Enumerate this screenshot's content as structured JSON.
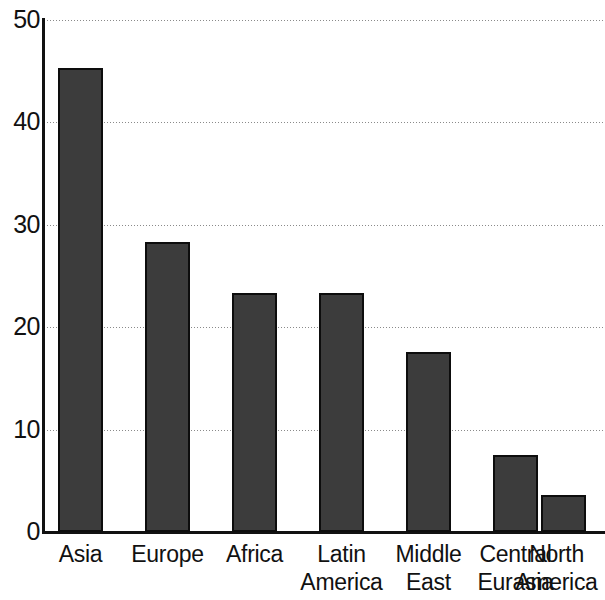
{
  "chart_data": {
    "type": "bar",
    "title": "",
    "subtitle": "",
    "xlabel": "",
    "ylabel": "",
    "ylim": [
      0,
      50
    ],
    "yticks": [
      0,
      10,
      20,
      30,
      40,
      50
    ],
    "ytick_labels": [
      "0",
      "10",
      "20",
      "30",
      "40",
      "50"
    ],
    "grid": true,
    "grid_axis": "y",
    "grid_style": "dotted",
    "legend": false,
    "legend_position": "none",
    "bar_color": "#3c3c3c",
    "bar_edge_color": "#0d0d0d",
    "axis_color": "#111111",
    "background": "#ffffff",
    "categories": [
      "Asia",
      "Europe",
      "Africa",
      "Latin America",
      "Middle East",
      "Central Eurasia",
      "North America"
    ],
    "category_lines": [
      [
        "Asia"
      ],
      [
        "Europe"
      ],
      [
        "Africa"
      ],
      [
        "Latin",
        "America"
      ],
      [
        "Middle",
        "East"
      ],
      [
        "Central",
        "Eurasia"
      ],
      [
        "North",
        "America"
      ]
    ],
    "values": [
      45.3,
      28.3,
      23.3,
      23.3,
      17.6,
      7.5,
      3.6
    ]
  }
}
